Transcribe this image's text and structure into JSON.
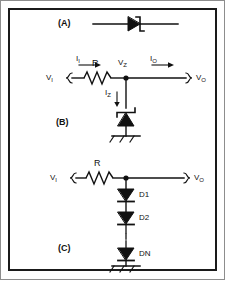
{
  "figure": {
    "background_color": "#ffffff",
    "line_color": "#111111",
    "frame_color": "#1a1a1a"
  },
  "panels": [
    {
      "id": "A",
      "label": "(A)",
      "description": "Zener diode schematic symbol",
      "components": [
        {
          "name": "zener-diode-symbol",
          "label": ""
        }
      ]
    },
    {
      "id": "B",
      "label": "(B)",
      "description": "Zener shunt voltage regulator",
      "nodes": [
        {
          "name": "input-terminal",
          "label": "V",
          "sub": "I"
        },
        {
          "name": "zener-node",
          "label": "V",
          "sub": "Z"
        },
        {
          "name": "output-terminal",
          "label": "V",
          "sub": "O"
        }
      ],
      "currents": [
        {
          "name": "input-current",
          "label": "I",
          "sub": "I"
        },
        {
          "name": "output-current",
          "label": "I",
          "sub": "O"
        },
        {
          "name": "zener-current",
          "label": "I",
          "sub": "Z"
        }
      ],
      "components": [
        {
          "name": "series-resistor",
          "label": "R"
        },
        {
          "name": "zener-diode",
          "label": ""
        },
        {
          "name": "ground",
          "label": ""
        }
      ]
    },
    {
      "id": "C",
      "label": "(C)",
      "description": "Series diode string regulator",
      "nodes": [
        {
          "name": "input-terminal",
          "label": "V",
          "sub": "I"
        },
        {
          "name": "output-terminal",
          "label": "V",
          "sub": "O"
        }
      ],
      "components": [
        {
          "name": "series-resistor",
          "label": "R"
        },
        {
          "name": "diode-1",
          "label": "D1"
        },
        {
          "name": "diode-2",
          "label": "D2"
        },
        {
          "name": "diode-n",
          "label": "DN"
        },
        {
          "name": "ground",
          "label": ""
        }
      ]
    }
  ],
  "labels": {
    "panel_a": "(A)",
    "panel_b": "(B)",
    "panel_c": "(C)",
    "v_in": "V",
    "v_in_sub": "I",
    "v_z": "V",
    "v_z_sub": "Z",
    "v_out": "V",
    "v_out_sub": "O",
    "i_in": "I",
    "i_in_sub": "I",
    "i_out": "I",
    "i_out_sub": "O",
    "i_z": "I",
    "i_z_sub": "Z",
    "resistor_b": "R",
    "resistor_c": "R",
    "d1": "D1",
    "d2": "D2",
    "dn": "DN"
  }
}
